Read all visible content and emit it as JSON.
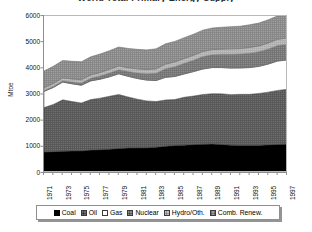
{
  "chart_data": {
    "type": "area",
    "stacked": true,
    "title": "World Total Primary Energy Supply",
    "xlabel": "",
    "ylabel": "Mtoe",
    "ylim": [
      0,
      6000
    ],
    "ytick_step": 1000,
    "yticks": [
      "0",
      "1000",
      "2000",
      "3000",
      "4000",
      "5000",
      "6000"
    ],
    "grid": false,
    "legend_position": "bottom",
    "x": [
      1971,
      1972,
      1973,
      1974,
      1975,
      1976,
      1977,
      1978,
      1979,
      1980,
      1981,
      1982,
      1983,
      1984,
      1985,
      1986,
      1987,
      1988,
      1989,
      1990,
      1991,
      1992,
      1993,
      1994,
      1995,
      1996,
      1997
    ],
    "categories": [
      "1971",
      "1972",
      "1973",
      "1974",
      "1975",
      "1976",
      "1977",
      "1978",
      "1979",
      "1980",
      "1981",
      "1982",
      "1983",
      "1984",
      "1985",
      "1986",
      "1987",
      "1988",
      "1989",
      "1990",
      "1991",
      "1992",
      "1993",
      "1994",
      "1995",
      "1996",
      "1997"
    ],
    "xtick_labels": [
      "1971",
      "1973",
      "1975",
      "1977",
      "1979",
      "1981",
      "1983",
      "1985",
      "1987",
      "1989",
      "1991",
      "1993",
      "1995",
      "1997"
    ],
    "series": [
      {
        "name": "Coal",
        "color": "#000000",
        "values": [
          800,
          815,
          835,
          840,
          845,
          875,
          890,
          905,
          940,
          955,
          960,
          965,
          985,
          1020,
          1050,
          1065,
          1085,
          1100,
          1105,
          1090,
          1065,
          1050,
          1050,
          1055,
          1075,
          1090,
          1100
        ]
      },
      {
        "name": "Oil",
        "color": "#6d6d6d",
        "values": [
          1700,
          1805,
          1960,
          1890,
          1830,
          1930,
          1970,
          2025,
          2060,
          1950,
          1860,
          1790,
          1745,
          1770,
          1760,
          1830,
          1855,
          1900,
          1925,
          1935,
          1930,
          1955,
          1955,
          1985,
          2015,
          2065,
          2100
        ]
      },
      {
        "name": "Gas",
        "color": "#ffffff",
        "values": [
          620,
          650,
          680,
          680,
          680,
          715,
          725,
          745,
          790,
          790,
          790,
          795,
          805,
          865,
          880,
          890,
          935,
          975,
          1000,
          1005,
          1015,
          1010,
          1025,
          1035,
          1075,
          1125,
          1120
        ]
      },
      {
        "name": "Nuclear",
        "color": "#8b8b8b",
        "values": [
          30,
          40,
          50,
          65,
          85,
          100,
          125,
          145,
          155,
          180,
          215,
          240,
          275,
          330,
          375,
          405,
          435,
          475,
          490,
          505,
          525,
          530,
          550,
          560,
          575,
          595,
          600
        ]
      },
      {
        "name": "Hydro/Oth.",
        "color": "#c2c2c2",
        "values": [
          105,
          110,
          110,
          120,
          125,
          125,
          130,
          140,
          145,
          150,
          155,
          160,
          170,
          175,
          180,
          185,
          190,
          195,
          195,
          200,
          210,
          210,
          220,
          220,
          230,
          235,
          240
        ]
      },
      {
        "name": "Comb. Renew.",
        "color": "#9e9e9e",
        "values": [
          645,
          655,
          665,
          675,
          685,
          695,
          705,
          715,
          725,
          735,
          745,
          755,
          765,
          775,
          785,
          795,
          805,
          815,
          825,
          835,
          845,
          855,
          865,
          875,
          885,
          895,
          905
        ]
      }
    ],
    "totals": [
      3900,
      4075,
      4300,
      4270,
      4250,
      4440,
      4545,
      4675,
      4815,
      4760,
      4725,
      4705,
      4745,
      4935,
      5030,
      5170,
      5305,
      5460,
      5540,
      5570,
      5590,
      5610,
      5665,
      5730,
      5855,
      6005,
      6065
    ]
  },
  "legend": {
    "items": [
      {
        "label": "Coal",
        "swatch": "sw-coal"
      },
      {
        "label": "Oil",
        "swatch": "sw-oil"
      },
      {
        "label": "Gas",
        "swatch": "sw-gas"
      },
      {
        "label": "Nuclear",
        "swatch": "sw-nuclear"
      },
      {
        "label": "Hydro/Oth.",
        "swatch": "sw-hydro"
      },
      {
        "label": "Comb. Renew.",
        "swatch": "sw-renew"
      }
    ]
  }
}
